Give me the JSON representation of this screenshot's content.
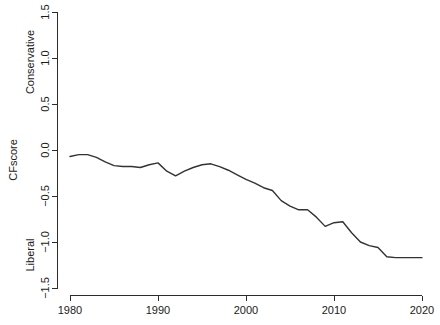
{
  "chart_data": {
    "type": "line",
    "title": "",
    "xlabel": "",
    "ylabel": "CFscore",
    "xlim": [
      1979,
      2020
    ],
    "ylim": [
      -1.5,
      1.5
    ],
    "grid": false,
    "legend": null,
    "axis_pole_labels": {
      "high": "Conservative",
      "low": "Liberal"
    },
    "xticks": [
      1980,
      1990,
      2000,
      2010,
      2020
    ],
    "xtick_labels": [
      "1980",
      "1990",
      "2000",
      "2010",
      "2020"
    ],
    "yticks": [
      -1.5,
      -1.0,
      -0.5,
      0.0,
      0.5,
      1.0,
      1.5
    ],
    "ytick_labels": [
      "-1.5",
      "-1.0",
      "-0.5",
      "0.0",
      "0.5",
      "1.0",
      "1.5"
    ],
    "series": [
      {
        "name": "CFscore",
        "color": "#333333",
        "x": [
          1980,
          1981,
          1982,
          1983,
          1984,
          1985,
          1986,
          1987,
          1988,
          1989,
          1990,
          1991,
          1992,
          1993,
          1994,
          1995,
          1996,
          1997,
          1998,
          1999,
          2000,
          2001,
          2002,
          2003,
          2004,
          2005,
          2006,
          2007,
          2008,
          2009,
          2010,
          2011,
          2012,
          2013,
          2014,
          2015,
          2016,
          2017,
          2018,
          2019,
          2020
        ],
        "values": [
          -0.07,
          -0.05,
          -0.05,
          -0.08,
          -0.13,
          -0.17,
          -0.18,
          -0.18,
          -0.19,
          -0.16,
          -0.14,
          -0.23,
          -0.28,
          -0.23,
          -0.19,
          -0.16,
          -0.15,
          -0.18,
          -0.22,
          -0.27,
          -0.32,
          -0.36,
          -0.41,
          -0.44,
          -0.55,
          -0.61,
          -0.65,
          -0.65,
          -0.73,
          -0.83,
          -0.79,
          -0.78,
          -0.9,
          -1.0,
          -1.04,
          -1.06,
          -1.16,
          -1.17,
          -1.17,
          -1.17,
          -1.17
        ]
      }
    ]
  },
  "axes": {
    "y_title": "CFscore",
    "y_high_label": "Conservative",
    "y_low_label": "Liberal"
  }
}
